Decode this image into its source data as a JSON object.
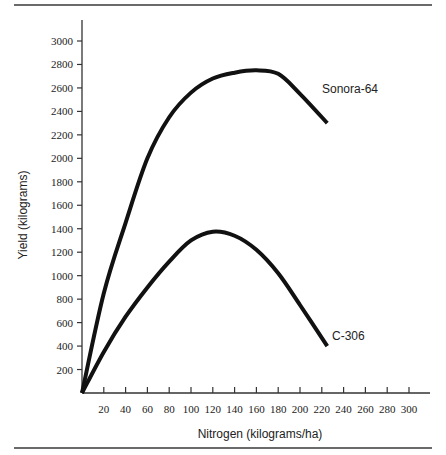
{
  "chart_data": {
    "type": "line",
    "title": "",
    "xlabel": "Nitrogen (kilograms/ha)",
    "ylabel": "Yield (kilograms)",
    "xlim": [
      0,
      300
    ],
    "ylim": [
      0,
      3000
    ],
    "grid": false,
    "legend": "inline labels at curve ends",
    "x_ticks": [
      20,
      40,
      60,
      80,
      100,
      120,
      140,
      160,
      180,
      200,
      220,
      240,
      260,
      280,
      300
    ],
    "y_ticks": [
      200,
      400,
      600,
      800,
      1000,
      1200,
      1400,
      1600,
      1800,
      2000,
      2200,
      2400,
      2600,
      2800,
      3000
    ],
    "series": [
      {
        "name": "Sonora-64",
        "x": [
          0,
          20,
          40,
          60,
          80,
          100,
          120,
          140,
          160,
          180,
          200,
          225
        ],
        "values": [
          0,
          850,
          1450,
          2000,
          2350,
          2560,
          2680,
          2730,
          2750,
          2720,
          2550,
          2300
        ]
      },
      {
        "name": "C-306",
        "x": [
          0,
          20,
          40,
          60,
          80,
          100,
          120,
          140,
          160,
          180,
          200,
          225
        ],
        "values": [
          0,
          350,
          650,
          900,
          1120,
          1300,
          1375,
          1340,
          1220,
          1020,
          750,
          400
        ]
      }
    ]
  },
  "colors": {
    "line": "#111111",
    "axis": "#333333",
    "rule": "#6a6a6a"
  }
}
